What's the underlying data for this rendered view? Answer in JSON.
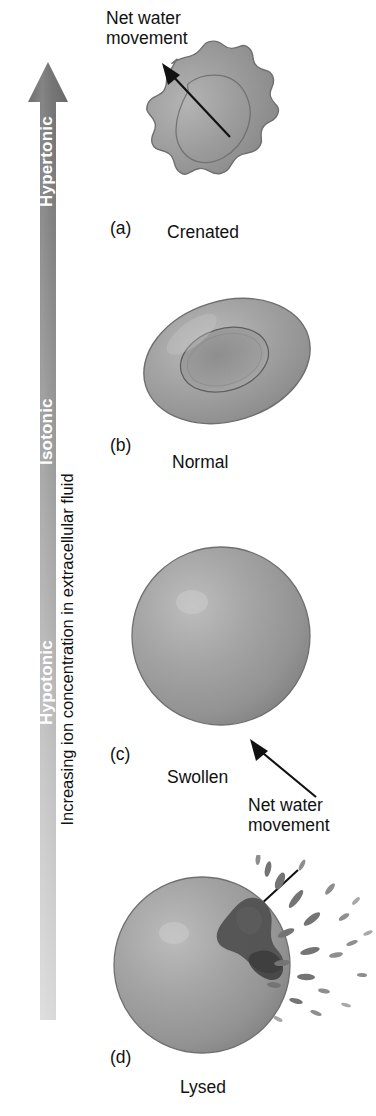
{
  "figure": {
    "background_color": "#ffffff",
    "axis": {
      "label": "Increasing ion concentration in extracellular fluid",
      "direction": "up",
      "arrow_color_top": "#6e6e6e",
      "arrow_color_bottom": "#cfcfcf",
      "zones": [
        {
          "id": "hypertonic",
          "label": "Hypertonic"
        },
        {
          "id": "isotonic",
          "label": "Isotonic"
        },
        {
          "id": "hypotonic",
          "label": "Hypotonic"
        }
      ]
    },
    "annotations": [
      {
        "id": "net-water-top",
        "text": "Net water\nmovement",
        "arrow": "out-of-cell"
      },
      {
        "id": "net-water-bottom",
        "text": "Net water\nmovement",
        "arrow": "into-cell"
      }
    ],
    "panels": [
      {
        "letter": "(a)",
        "caption": "Crenated",
        "condition": "Hypertonic",
        "cell_shape": "crenated-shrunken-disc"
      },
      {
        "letter": "(b)",
        "caption": "Normal",
        "condition": "Isotonic",
        "cell_shape": "biconcave-disc"
      },
      {
        "letter": "(c)",
        "caption": "Swollen",
        "condition": "Hypotonic",
        "cell_shape": "sphere"
      },
      {
        "letter": "(d)",
        "caption": "Lysed",
        "condition": "Hypotonic",
        "cell_shape": "ruptured-sphere"
      }
    ],
    "colors": {
      "cell_fill": "#9a9a9a",
      "cell_outline": "#6d6d6d",
      "cell_highlight": "#c4c4c4",
      "rupture_dark": "#555555",
      "text": "#111111"
    }
  }
}
